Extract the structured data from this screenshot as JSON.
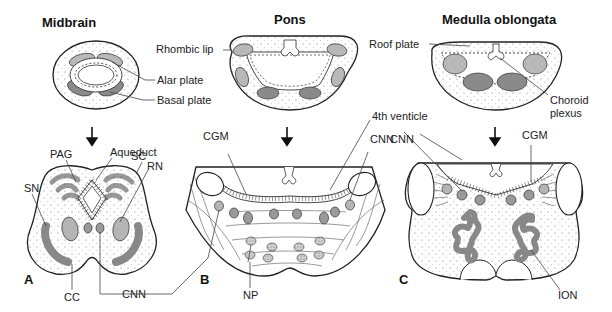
{
  "titles": {
    "midbrain": "Midbrain",
    "pons": "Pons",
    "medulla": "Medulla oblongata"
  },
  "embryonic_labels": {
    "rhombic_lip": "Rhombic lip",
    "alar_plate": "Alar plate",
    "basal_plate": "Basal plate",
    "roof_plate": "Roof plate",
    "choroid_plexus_line1": "Choroid",
    "choroid_plexus_line2": "plexus"
  },
  "panels": {
    "a": {
      "letter": "A",
      "labels": {
        "pag": "PAG",
        "aqueduct": "Aqueduct",
        "sc": "SC",
        "rn": "RN",
        "sn": "SN",
        "cc": "CC"
      }
    },
    "b": {
      "letter": "B",
      "labels": {
        "cgm": "CGM",
        "fourth_ventricle": "4th venticle",
        "np": "NP"
      }
    },
    "c": {
      "letter": "C",
      "labels": {
        "cnn": "CNN",
        "cgm": "CGM",
        "ion": "ION"
      }
    }
  },
  "shared_labels": {
    "cnn": "CNN"
  },
  "colors": {
    "alar": "#b8b8b8",
    "basal": "#8a8a8a",
    "outline": "#222222"
  }
}
